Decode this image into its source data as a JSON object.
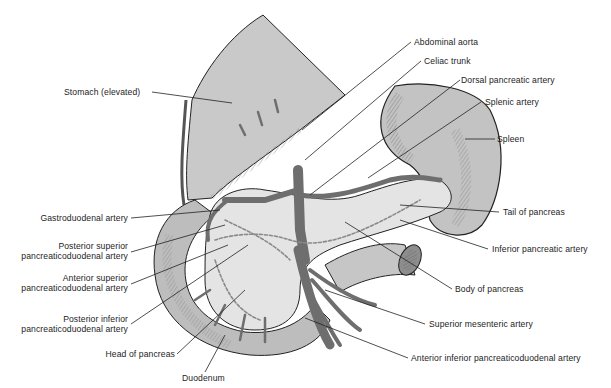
{
  "diagram": {
    "colors": {
      "organ_fill": "#c9c9c9",
      "organ_dark": "#9d9d9d",
      "pancreas_fill": "#e4e4e4",
      "vessel": "#6e6e6e",
      "outline": "#222222",
      "text": "#1d1d1d"
    },
    "labels": {
      "stomach": "Stomach (elevated)",
      "abdominal_aorta": "Abdominal aorta",
      "celiac_trunk": "Celiac trunk",
      "dorsal_pancreatic_artery": "Dorsal pancreatic artery",
      "splenic_artery": "Splenic artery",
      "spleen": "Spleen",
      "gastroduodenal_artery": "Gastroduodenal artery",
      "post_sup_pd_1": "Posterior superior",
      "post_sup_pd_2": "pancreaticoduodenal artery",
      "ant_sup_pd_1": "Anterior superior",
      "ant_sup_pd_2": "pancreaticoduodenal artery",
      "post_inf_pd_1": "Posterior inferior",
      "post_inf_pd_2": "pancreaticoduodenal artery",
      "head_of_pancreas": "Head of pancreas",
      "duodenum": "Duodenum",
      "tail_of_pancreas": "Tail of pancreas",
      "inferior_pancreatic_artery": "Inferior pancreatic artery",
      "body_of_pancreas": "Body of pancreas",
      "superior_mesenteric_artery": "Superior mesenteric artery",
      "ant_inf_pd": "Anterior inferior pancreaticoduodenal artery"
    }
  }
}
